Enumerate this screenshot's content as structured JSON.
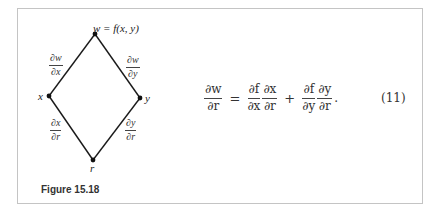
{
  "figure": {
    "caption": "Figure 15.18",
    "nodes": {
      "top": {
        "label": "w = f(x,  y)",
        "x": 95,
        "y": 34
      },
      "left": {
        "label": "x",
        "x": 49,
        "y": 96
      },
      "right": {
        "label": "y",
        "x": 140,
        "y": 98
      },
      "bottom": {
        "label": "r",
        "x": 93,
        "y": 160
      }
    },
    "edge_labels": {
      "top_left": {
        "num": "∂w",
        "den": "∂x"
      },
      "top_right": {
        "num": "∂w",
        "den": "∂y"
      },
      "bottom_left": {
        "num": "∂x",
        "den": "∂r"
      },
      "bottom_right": {
        "num": "∂y",
        "den": "∂r"
      }
    }
  },
  "equation": {
    "lhs": {
      "num": "∂w",
      "den": "∂r"
    },
    "equals": "=",
    "term1": [
      {
        "num": "∂f",
        "den": "∂x"
      },
      {
        "num": "∂x",
        "den": "∂r"
      }
    ],
    "plus": "+",
    "term2": [
      {
        "num": "∂f",
        "den": "∂y"
      },
      {
        "num": "∂y",
        "den": "∂r"
      }
    ],
    "period": ".",
    "number": "(11)"
  }
}
